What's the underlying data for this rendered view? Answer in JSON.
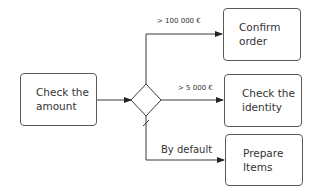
{
  "diagram": {
    "type": "flowchart",
    "nodes": [
      {
        "id": "check-amount",
        "label": "Check the\namount",
        "shape": "rounded-rect"
      },
      {
        "id": "decision",
        "label": "",
        "shape": "diamond"
      },
      {
        "id": "confirm-order",
        "label": "Confirm\norder",
        "shape": "rounded-rect"
      },
      {
        "id": "check-identity",
        "label": "Check the\nidentity",
        "shape": "rounded-rect"
      },
      {
        "id": "prepare-items",
        "label": "Prepare\nItems",
        "shape": "rounded-rect"
      }
    ],
    "edges": [
      {
        "from": "check-amount",
        "to": "decision",
        "label": ""
      },
      {
        "from": "decision",
        "to": "confirm-order",
        "label": "> 100 000 €"
      },
      {
        "from": "decision",
        "to": "check-identity",
        "label": "> 5 000 €"
      },
      {
        "from": "decision",
        "to": "prepare-items",
        "label": "By default",
        "default_flow": true
      }
    ],
    "colors": {
      "stroke": "#3a3a3a",
      "text": "#333333",
      "background": "#ffffff"
    }
  }
}
